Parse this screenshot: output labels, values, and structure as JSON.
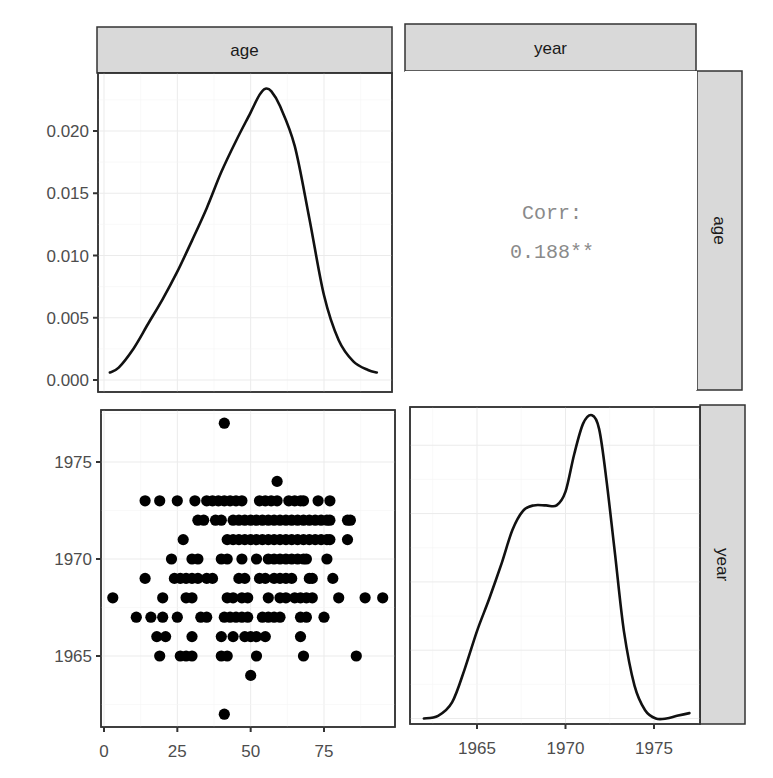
{
  "chart_data": {
    "type": "scatter-matrix",
    "title": "",
    "variables": [
      "age",
      "year"
    ],
    "strips": {
      "top": [
        "age",
        "year"
      ],
      "right": [
        "age",
        "year"
      ]
    },
    "panels": {
      "age_density": {
        "type": "line",
        "position": "row1-col1",
        "xlabel": "age",
        "ylabel": "density",
        "xlim": [
          -2,
          97
        ],
        "ylim": [
          0,
          0.0245
        ],
        "y_ticks": [
          0.0,
          0.005,
          0.01,
          0.015,
          0.02
        ],
        "y_tick_labels": [
          "0.000",
          "0.005",
          "0.010",
          "0.015",
          "0.020"
        ],
        "x": [
          2,
          5,
          10,
          15,
          20,
          25,
          30,
          35,
          40,
          45,
          50,
          53,
          55,
          57,
          60,
          65,
          70,
          75,
          80,
          85,
          90,
          93
        ],
        "y": [
          0.0006,
          0.001,
          0.0025,
          0.0045,
          0.0065,
          0.0087,
          0.0112,
          0.0138,
          0.0167,
          0.0192,
          0.0215,
          0.0229,
          0.0234,
          0.0232,
          0.022,
          0.0188,
          0.013,
          0.0068,
          0.0032,
          0.0015,
          0.0008,
          0.0006
        ]
      },
      "correlation": {
        "type": "text",
        "position": "row1-col2",
        "label": "Corr:",
        "value": "0.188**"
      },
      "age_year_scatter": {
        "type": "scatter",
        "position": "row2-col1",
        "xlabel": "age",
        "ylabel": "year",
        "xlim": [
          -1,
          98
        ],
        "ylim": [
          1961.3,
          1977.8
        ],
        "x_ticks": [
          0,
          25,
          50,
          75
        ],
        "x_tick_labels": [
          "0",
          "25",
          "50",
          "75"
        ],
        "y_ticks": [
          1965,
          1970,
          1975
        ],
        "y_tick_labels": [
          "1965",
          "1970",
          "1975"
        ],
        "points": [
          [
            41,
            1977
          ],
          [
            59,
            1974
          ],
          [
            14,
            1973
          ],
          [
            19,
            1973
          ],
          [
            25,
            1973
          ],
          [
            31,
            1973
          ],
          [
            35,
            1973
          ],
          [
            37,
            1973
          ],
          [
            39,
            1973
          ],
          [
            41,
            1973
          ],
          [
            43,
            1973
          ],
          [
            45,
            1973
          ],
          [
            47,
            1973
          ],
          [
            53,
            1973
          ],
          [
            55,
            1973
          ],
          [
            57,
            1973
          ],
          [
            59,
            1973
          ],
          [
            63,
            1973
          ],
          [
            65,
            1973
          ],
          [
            67,
            1973
          ],
          [
            68,
            1973
          ],
          [
            73,
            1973
          ],
          [
            77,
            1973
          ],
          [
            32,
            1972
          ],
          [
            34,
            1972
          ],
          [
            38,
            1972
          ],
          [
            40,
            1972
          ],
          [
            44,
            1972
          ],
          [
            46,
            1972
          ],
          [
            48,
            1972
          ],
          [
            50,
            1972
          ],
          [
            52,
            1972
          ],
          [
            54,
            1972
          ],
          [
            56,
            1972
          ],
          [
            58,
            1972
          ],
          [
            60,
            1972
          ],
          [
            62,
            1972
          ],
          [
            64,
            1972
          ],
          [
            66,
            1972
          ],
          [
            68,
            1972
          ],
          [
            70,
            1972
          ],
          [
            72,
            1972
          ],
          [
            74,
            1972
          ],
          [
            76,
            1972
          ],
          [
            77,
            1972
          ],
          [
            83,
            1972
          ],
          [
            84,
            1972
          ],
          [
            27,
            1971
          ],
          [
            42,
            1971
          ],
          [
            44,
            1971
          ],
          [
            46,
            1971
          ],
          [
            48,
            1971
          ],
          [
            50,
            1971
          ],
          [
            52,
            1971
          ],
          [
            54,
            1971
          ],
          [
            56,
            1971
          ],
          [
            58,
            1971
          ],
          [
            60,
            1971
          ],
          [
            62,
            1971
          ],
          [
            64,
            1971
          ],
          [
            66,
            1971
          ],
          [
            68,
            1971
          ],
          [
            70,
            1971
          ],
          [
            72,
            1971
          ],
          [
            74,
            1971
          ],
          [
            76,
            1971
          ],
          [
            77,
            1971
          ],
          [
            83,
            1971
          ],
          [
            23,
            1970
          ],
          [
            30,
            1970
          ],
          [
            32,
            1970
          ],
          [
            40,
            1970
          ],
          [
            42,
            1970
          ],
          [
            47,
            1970
          ],
          [
            52,
            1970
          ],
          [
            56,
            1970
          ],
          [
            58,
            1970
          ],
          [
            60,
            1970
          ],
          [
            62,
            1970
          ],
          [
            64,
            1970
          ],
          [
            66,
            1970
          ],
          [
            68,
            1970
          ],
          [
            69,
            1970
          ],
          [
            76,
            1970
          ],
          [
            14,
            1969
          ],
          [
            24,
            1969
          ],
          [
            26,
            1969
          ],
          [
            28,
            1969
          ],
          [
            30,
            1969
          ],
          [
            32,
            1969
          ],
          [
            35,
            1969
          ],
          [
            37,
            1969
          ],
          [
            46,
            1969
          ],
          [
            48,
            1969
          ],
          [
            53,
            1969
          ],
          [
            55,
            1969
          ],
          [
            58,
            1969
          ],
          [
            60,
            1969
          ],
          [
            62,
            1969
          ],
          [
            64,
            1969
          ],
          [
            70,
            1969
          ],
          [
            71,
            1969
          ],
          [
            78,
            1969
          ],
          [
            3,
            1968
          ],
          [
            20,
            1968
          ],
          [
            28,
            1968
          ],
          [
            30,
            1968
          ],
          [
            42,
            1968
          ],
          [
            44,
            1968
          ],
          [
            47,
            1968
          ],
          [
            49,
            1968
          ],
          [
            56,
            1968
          ],
          [
            60,
            1968
          ],
          [
            62,
            1968
          ],
          [
            65,
            1968
          ],
          [
            67,
            1968
          ],
          [
            69,
            1968
          ],
          [
            71,
            1968
          ],
          [
            80,
            1968
          ],
          [
            89,
            1968
          ],
          [
            95,
            1968
          ],
          [
            11,
            1967
          ],
          [
            16,
            1967
          ],
          [
            20,
            1967
          ],
          [
            25,
            1967
          ],
          [
            33,
            1967
          ],
          [
            35,
            1967
          ],
          [
            41,
            1967
          ],
          [
            43,
            1967
          ],
          [
            45,
            1967
          ],
          [
            47,
            1967
          ],
          [
            49,
            1967
          ],
          [
            54,
            1967
          ],
          [
            56,
            1967
          ],
          [
            58,
            1967
          ],
          [
            60,
            1967
          ],
          [
            67,
            1967
          ],
          [
            69,
            1967
          ],
          [
            75,
            1967
          ],
          [
            18,
            1966
          ],
          [
            21,
            1966
          ],
          [
            30,
            1966
          ],
          [
            40,
            1966
          ],
          [
            44,
            1966
          ],
          [
            48,
            1966
          ],
          [
            50,
            1966
          ],
          [
            52,
            1966
          ],
          [
            55,
            1966
          ],
          [
            67,
            1966
          ],
          [
            19,
            1965
          ],
          [
            26,
            1965
          ],
          [
            28,
            1965
          ],
          [
            30,
            1965
          ],
          [
            40,
            1965
          ],
          [
            42,
            1965
          ],
          [
            52,
            1965
          ],
          [
            68,
            1965
          ],
          [
            86,
            1965
          ],
          [
            50,
            1964
          ],
          [
            41,
            1962
          ]
        ]
      },
      "year_density": {
        "type": "line",
        "position": "row2-col2",
        "xlabel": "year",
        "ylabel": "density",
        "xlim": [
          1961.2,
          1977.7
        ],
        "ylim": [
          -0.002,
          0.114
        ],
        "x_ticks": [
          1965,
          1970,
          1975
        ],
        "x_tick_labels": [
          "1965",
          "1970",
          "1975"
        ],
        "x": [
          1962.0,
          1962.8,
          1963.6,
          1964.3,
          1965.0,
          1965.7,
          1966.4,
          1967.0,
          1967.6,
          1968.2,
          1968.9,
          1969.5,
          1970.0,
          1970.5,
          1971.0,
          1971.5,
          1971.9,
          1972.3,
          1972.8,
          1973.3,
          1973.9,
          1974.5,
          1975.1,
          1975.7,
          1976.3,
          1977.0
        ],
        "y": [
          0.0,
          0.001,
          0.006,
          0.018,
          0.032,
          0.044,
          0.057,
          0.069,
          0.076,
          0.078,
          0.078,
          0.078,
          0.083,
          0.097,
          0.108,
          0.111,
          0.106,
          0.088,
          0.06,
          0.032,
          0.012,
          0.003,
          0.0,
          0.0,
          0.001,
          0.002
        ]
      }
    }
  }
}
